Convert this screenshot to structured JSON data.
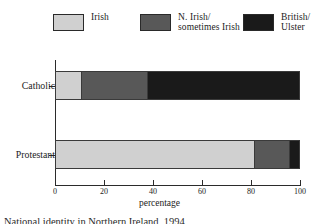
{
  "chart_data": {
    "type": "bar",
    "orientation": "horizontal",
    "stacked": true,
    "title": "",
    "xlabel": "percentage",
    "ylabel": "",
    "xlim": [
      0,
      100
    ],
    "xticks": [
      0,
      20,
      40,
      60,
      80,
      100
    ],
    "xticklabels": [
      "0",
      "20",
      "40",
      "60",
      "80",
      "100"
    ],
    "grid": false,
    "legend_position": "top",
    "categories": [
      "Catholic",
      "Protestant"
    ],
    "series": [
      {
        "name": "Irish",
        "color": "#d0d0d0",
        "values": [
          10,
          81
        ]
      },
      {
        "name": "N. Irish/\nsometimes Irish",
        "color": "#585858",
        "values": [
          27,
          14
        ]
      },
      {
        "name": "British/\nUlster",
        "color": "#1a1a1a",
        "values": [
          63,
          5
        ]
      }
    ]
  },
  "legend": {
    "entries": [
      {
        "label": "Irish",
        "color": "#d0d0d0"
      },
      {
        "label": "N. Irish/\nsometimes Irish",
        "color": "#585858"
      },
      {
        "label": "British/\nUlster",
        "color": "#1a1a1a"
      }
    ]
  },
  "axes": {
    "xlabel": "percentage",
    "xticklabels": [
      "0",
      "20",
      "40",
      "60",
      "80",
      "100"
    ],
    "category_labels": [
      "Catholic",
      "Protestant"
    ]
  },
  "caption": {
    "text": "National identity in Northern Ireland, 1994"
  }
}
